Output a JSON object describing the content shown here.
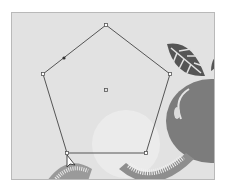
{
  "canvas": {
    "background": "#e2e2e2",
    "border": "#b9b9b9"
  },
  "selection": {
    "shape": "pentagon",
    "stroke": "#555555",
    "vertices": [
      [
        105,
        24
      ],
      [
        169,
        73
      ],
      [
        145,
        152
      ],
      [
        66,
        152
      ],
      [
        42,
        73
      ]
    ],
    "center_point": [
      105,
      89
    ],
    "anchor_dot": [
      63,
      57
    ]
  },
  "artwork": {
    "leaf_color": "#5a5a5a",
    "fruit_color": "#7a7a7a",
    "highlight_color": "#ededed",
    "slice_color": "#9a9a9a"
  },
  "cursor": {
    "type": "direct-selection-arrow",
    "position": [
      66,
      155
    ]
  }
}
